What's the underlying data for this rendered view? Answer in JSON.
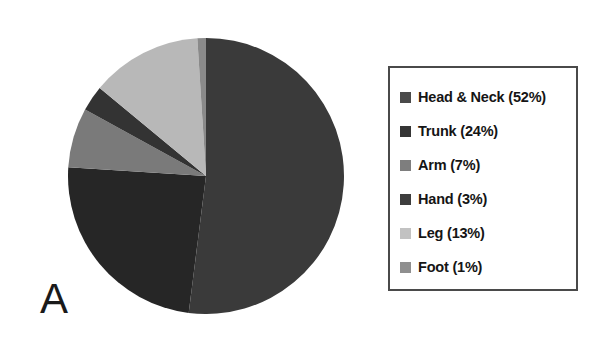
{
  "panel": {
    "label": "A"
  },
  "legend": {
    "items": [
      {
        "label": "Head & Neck (52%)",
        "color": "#4a4a4a"
      },
      {
        "label": "Trunk (24%)",
        "color": "#353535"
      },
      {
        "label": "Arm (7%)",
        "color": "#7e7e7e"
      },
      {
        "label": "Hand (3%)",
        "color": "#3d3d3d"
      },
      {
        "label": "Leg (13%)",
        "color": "#c2c2c2"
      },
      {
        "label": "Foot (1%)",
        "color": "#8f8f8f"
      }
    ]
  },
  "chart_data": {
    "type": "pie",
    "title": "",
    "categories": [
      "Head & Neck",
      "Trunk",
      "Arm",
      "Hand",
      "Leg",
      "Foot"
    ],
    "values": [
      52,
      24,
      7,
      3,
      13,
      1
    ],
    "unit": "%",
    "colors": [
      "#3a3a3a",
      "#262626",
      "#7a7a7a",
      "#333333",
      "#b8b8b8",
      "#8a8a8a"
    ],
    "start_angle_deg": 0,
    "direction": "clockwise",
    "legend_position": "right",
    "grid": false,
    "labels": [
      "Head & Neck (52%)",
      "Trunk (24%)",
      "Arm (7%)",
      "Hand (3%)",
      "Leg (13%)",
      "Foot (1%)"
    ]
  }
}
